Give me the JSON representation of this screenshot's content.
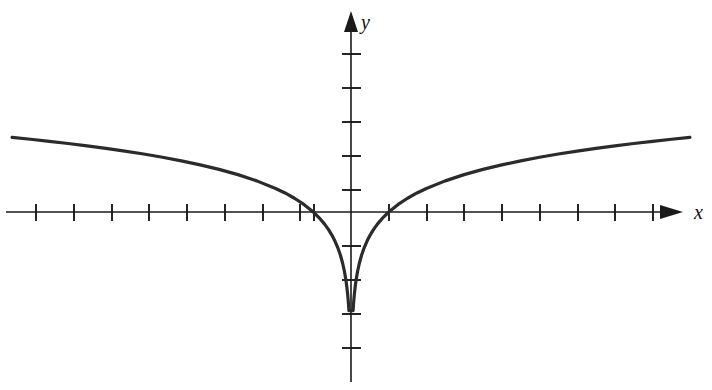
{
  "figure": {
    "background_color": "#ffffff",
    "curve_color": "#2b2b2b",
    "axis_color": "#1a1a1a"
  },
  "labels": {
    "x_axis": "x",
    "y_axis": "y"
  },
  "chart_data": {
    "type": "line",
    "title": "",
    "subtitle": "",
    "xlabel": "x",
    "ylabel": "y",
    "function": "y = ln|x|",
    "grid": false,
    "legend": null,
    "xlim": [
      -9.1,
      8.65
    ],
    "ylim": [
      -5.8,
      5.8
    ],
    "origin_px": [
      351,
      212
    ],
    "unit_px": {
      "x": 37.7,
      "y": 34.0
    },
    "x_ticks": [
      -9,
      -8,
      -7,
      -6,
      -5,
      -4,
      -3,
      -2,
      -1,
      1,
      2,
      3,
      4,
      5,
      6,
      7,
      8
    ],
    "y_ticks": [
      -4,
      -3,
      -2,
      -1,
      1,
      2,
      3,
      4,
      5
    ],
    "x_tick_labels": [],
    "y_tick_labels": [],
    "zero_crossings": [
      -1,
      1
    ],
    "clip_y_min": -2.9,
    "series": [
      {
        "name": "y = ln|x|",
        "x": [
          -8.99,
          -8.5,
          -8.0,
          -7.5,
          -7.0,
          -6.5,
          -6.0,
          -5.5,
          -5.0,
          -4.5,
          -4.0,
          -3.5,
          -3.0,
          -2.5,
          -2.0,
          -1.75,
          -1.5,
          -1.25,
          -1.0,
          -0.85,
          -0.7,
          -0.6,
          -0.5,
          -0.42,
          -0.34,
          -0.28,
          -0.22,
          -0.175,
          -0.14,
          -0.11,
          -0.09,
          -0.075,
          -0.065,
          -0.058,
          -0.055
        ],
        "y": [
          2.196,
          2.14,
          2.079,
          2.015,
          1.946,
          1.872,
          1.792,
          1.705,
          1.609,
          1.504,
          1.386,
          1.253,
          1.099,
          0.916,
          0.693,
          0.56,
          0.405,
          0.223,
          0.0,
          -0.163,
          -0.357,
          -0.511,
          -0.693,
          -0.868,
          -1.079,
          -1.273,
          -1.514,
          -1.743,
          -1.966,
          -2.207,
          -2.408,
          -2.59,
          -2.733,
          -2.847,
          -2.9
        ]
      },
      {
        "name": "y = ln|x| (right branch)",
        "x": [
          0.055,
          0.058,
          0.065,
          0.075,
          0.09,
          0.11,
          0.14,
          0.175,
          0.22,
          0.28,
          0.34,
          0.42,
          0.5,
          0.6,
          0.7,
          0.85,
          1.0,
          1.25,
          1.5,
          1.75,
          2.0,
          2.5,
          3.0,
          3.5,
          4.0,
          4.5,
          5.0,
          5.5,
          6.0,
          6.5,
          7.0,
          7.5,
          8.0,
          8.5,
          8.99
        ],
        "y": [
          -2.9,
          -2.847,
          -2.733,
          -2.59,
          -2.408,
          -2.207,
          -1.966,
          -1.743,
          -1.514,
          -1.273,
          -1.079,
          -0.868,
          -0.693,
          -0.511,
          -0.357,
          -0.163,
          0.0,
          0.223,
          0.405,
          0.56,
          0.693,
          0.916,
          1.099,
          1.253,
          1.386,
          1.504,
          1.609,
          1.705,
          1.792,
          1.872,
          1.946,
          2.015,
          2.079,
          2.14,
          2.196
        ]
      }
    ]
  }
}
